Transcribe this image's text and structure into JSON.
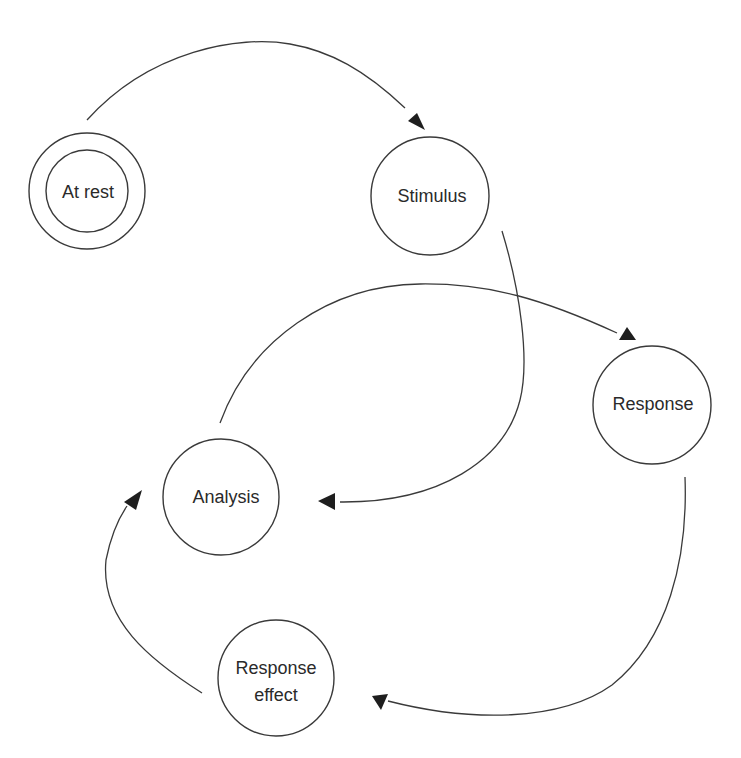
{
  "diagram": {
    "type": "state-cycle",
    "colors": {
      "stroke": "#3a3a3a",
      "arrowhead": "#1e1e1e",
      "text": "#2a2a2a",
      "background": "#ffffff"
    },
    "nodes": [
      {
        "id": "at-rest",
        "label": "At rest",
        "lines": [
          "At rest"
        ],
        "initial_state": true
      },
      {
        "id": "stimulus",
        "label": "Stimulus",
        "lines": [
          "Stimulus"
        ]
      },
      {
        "id": "response",
        "label": "Response",
        "lines": [
          "Response"
        ]
      },
      {
        "id": "analysis",
        "label": "Analysis",
        "lines": [
          "Analysis"
        ]
      },
      {
        "id": "response-effect",
        "label": "Response effect",
        "lines": [
          "Response",
          "effect"
        ]
      }
    ],
    "edges": [
      {
        "from": "at-rest",
        "to": "stimulus"
      },
      {
        "from": "stimulus",
        "to": "analysis"
      },
      {
        "from": "analysis",
        "to": "response"
      },
      {
        "from": "response",
        "to": "response-effect"
      },
      {
        "from": "response-effect",
        "to": "analysis"
      }
    ]
  }
}
